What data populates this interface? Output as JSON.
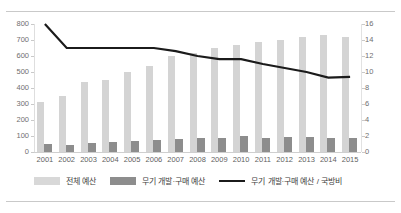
{
  "chart_data": {
    "type": "bar",
    "title": "",
    "subtitle": "",
    "xlabel": "",
    "ylabel": "",
    "grid": false,
    "legend_position": "bottom",
    "categories": [
      "2001",
      "2002",
      "2003",
      "2004",
      "2005",
      "2006",
      "2007",
      "2008",
      "2009",
      "2010",
      "2011",
      "2012",
      "2013",
      "2014",
      "2015"
    ],
    "axes": {
      "left": {
        "ylim": [
          0,
          800
        ],
        "ticks": [
          0,
          100,
          200,
          300,
          400,
          500,
          600,
          700,
          800
        ],
        "tick_labels": [
          "0",
          "100",
          "200",
          "300",
          "400",
          "500",
          "600",
          "700",
          "800"
        ]
      },
      "right": {
        "ylim": [
          0,
          16
        ],
        "ticks": [
          0,
          2,
          4,
          6,
          8,
          10,
          12,
          14,
          16
        ],
        "tick_labels": [
          "0",
          "2",
          "4",
          "6",
          "8",
          "10",
          "12",
          "14",
          "16"
        ]
      }
    },
    "series": [
      {
        "name": "전체 예산",
        "type": "bar",
        "axis": "left",
        "color": "#d4d4d4",
        "values": [
          310,
          350,
          440,
          450,
          500,
          540,
          600,
          620,
          650,
          670,
          690,
          700,
          720,
          730,
          720
        ]
      },
      {
        "name": "무기 개발·구매 예산",
        "type": "bar",
        "axis": "left",
        "color": "#8d8d8d",
        "values": [
          50,
          45,
          55,
          65,
          70,
          78,
          80,
          85,
          90,
          100,
          90,
          95,
          95,
          90,
          85
        ]
      },
      {
        "name": "무기 개발·구매 예산 / 국방비",
        "type": "line",
        "axis": "right",
        "color": "#1b1b1b",
        "values": [
          16.0,
          13.0,
          13.0,
          13.0,
          13.0,
          13.0,
          12.6,
          12.0,
          11.6,
          11.6,
          11.0,
          10.5,
          10.0,
          9.3,
          9.4
        ]
      }
    ]
  },
  "legend": {
    "items": [
      {
        "label": "전체 예산",
        "marker": "swatch-light",
        "color": "#d8d8d8"
      },
      {
        "label": "무기 개발·구매 예산",
        "marker": "swatch-dark",
        "color": "#8d8d8d"
      },
      {
        "label": "무기 개발·구매 예산 / 국방비",
        "marker": "line",
        "color": "#1b1b1b"
      }
    ]
  }
}
